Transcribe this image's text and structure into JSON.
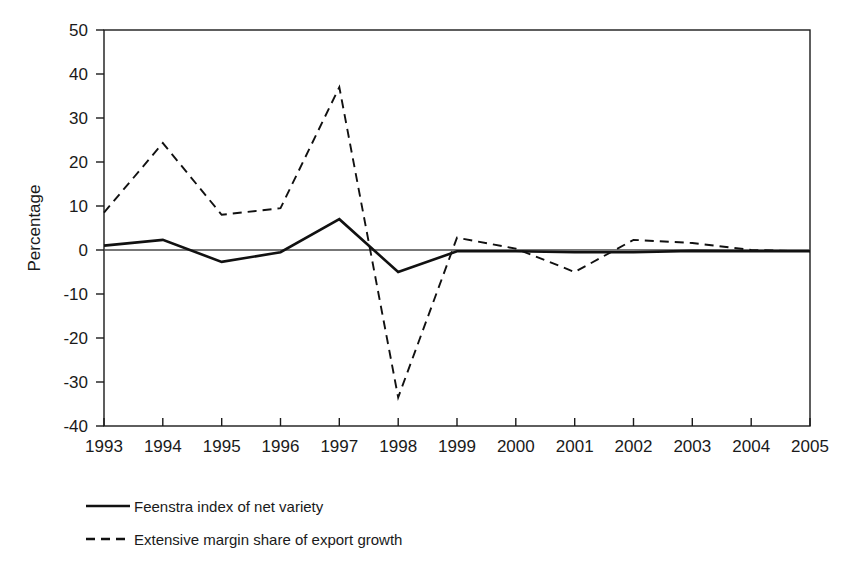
{
  "chart_data": {
    "type": "line",
    "title": "",
    "xlabel": "",
    "ylabel": "Percentage",
    "x": [
      1993,
      1994,
      1995,
      1996,
      1997,
      1998,
      1999,
      2000,
      2001,
      2002,
      2003,
      2004,
      2005
    ],
    "xticklabels": [
      "1993",
      "1994",
      "1995",
      "1996",
      "1997",
      "1998",
      "1999",
      "2000",
      "2001",
      "2002",
      "2003",
      "2004",
      "2005"
    ],
    "yticklabels": [
      "50",
      "40",
      "30",
      "20",
      "10",
      "0",
      "-10",
      "-20",
      "-30",
      "-40"
    ],
    "yticks": [
      50,
      40,
      30,
      20,
      10,
      0,
      -10,
      -20,
      -30,
      -40
    ],
    "ylim": [
      -40,
      50
    ],
    "xlim": [
      1993,
      2005
    ],
    "grid": false,
    "legend_position": "below-left",
    "zero_line": true,
    "series": [
      {
        "name": "Feenstra index of net variety",
        "style": "solid",
        "color": "#111111",
        "values": [
          1.0,
          2.3,
          -2.7,
          -0.5,
          7.0,
          -5.0,
          -0.3,
          -0.3,
          -0.5,
          -0.5,
          -0.2,
          -0.3,
          -0.3
        ]
      },
      {
        "name": "Extensive margin share of export growth",
        "style": "dashed",
        "color": "#111111",
        "values": [
          8.5,
          24.3,
          8.0,
          9.5,
          37.0,
          -33.5,
          2.8,
          0.3,
          -5.0,
          2.3,
          1.6,
          0.0,
          -0.3
        ]
      }
    ]
  },
  "legend": {
    "items": [
      {
        "label": "Feenstra index of net variety",
        "style": "solid"
      },
      {
        "label": "Extensive margin share of export growth",
        "style": "dashed"
      }
    ]
  }
}
